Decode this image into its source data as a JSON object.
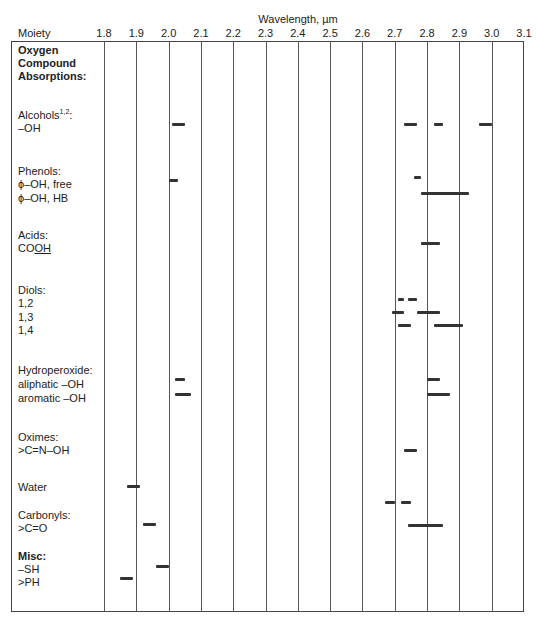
{
  "header": {
    "x_axis_title": "Wavelength, µm",
    "moiety_header": "Moiety"
  },
  "labels": [
    {
      "id": "oxygen-1",
      "text": "Oxygen",
      "y": 44,
      "bold": true
    },
    {
      "id": "oxygen-2",
      "text": "Compound",
      "y": 57,
      "bold": true
    },
    {
      "id": "oxygen-3",
      "text": "Absorptions:",
      "y": 70,
      "bold": true
    },
    {
      "id": "alcohols",
      "text": "Alcohols",
      "sup": "1,2",
      "suffix": ":",
      "y": 109
    },
    {
      "id": "alcohols-oh",
      "text": "–OH",
      "y": 122
    },
    {
      "id": "phenols",
      "text": "Phenols:",
      "y": 165
    },
    {
      "id": "phenol-free",
      "text": "ϕ–OH, free",
      "y": 178
    },
    {
      "id": "phenol-hb",
      "text": "ϕ–OH, HB",
      "y": 192
    },
    {
      "id": "acids",
      "text": "Acids:",
      "y": 229
    },
    {
      "id": "cooh",
      "text": "CO",
      "underline": "OH",
      "y": 242
    },
    {
      "id": "diols",
      "text": "Diols:",
      "y": 284
    },
    {
      "id": "diol-12",
      "text": "1,2",
      "y": 297
    },
    {
      "id": "diol-13",
      "text": "1,3",
      "y": 311
    },
    {
      "id": "diol-14",
      "text": "1,4",
      "y": 324
    },
    {
      "id": "hydroperoxide",
      "text": "Hydroperoxide:",
      "y": 364
    },
    {
      "id": "hp-aliphatic",
      "text": "aliphatic –OH",
      "y": 378
    },
    {
      "id": "hp-aromatic",
      "text": "aromatic –OH",
      "y": 392
    },
    {
      "id": "oximes",
      "text": "Oximes:",
      "y": 431
    },
    {
      "id": "oxime-group",
      "text": ">C=N–OH",
      "y": 444
    },
    {
      "id": "water",
      "text": "Water",
      "y": 481
    },
    {
      "id": "carbonyls",
      "text": "Carbonyls:",
      "y": 509
    },
    {
      "id": "carbonyl-group",
      "text": ">C=O",
      "y": 522
    },
    {
      "id": "misc",
      "text": "Misc:",
      "y": 550,
      "bold": true
    },
    {
      "id": "sh",
      "text": "–SH",
      "y": 563
    },
    {
      "id": "ph",
      "text": ">PH",
      "y": 576
    }
  ],
  "chart_data": {
    "type": "range-bar",
    "xlabel": "Wavelength, µm",
    "ylabel": "Moiety",
    "xlim": [
      1.8,
      3.1
    ],
    "x_ticks": [
      "1.8",
      "1.9",
      "2.0",
      "2.1",
      "2.2",
      "2.3",
      "2.4",
      "2.5",
      "2.6",
      "2.7",
      "2.8",
      "2.9",
      "3.0",
      "3.1"
    ],
    "grid": "vertical",
    "rows": [
      {
        "group": "Alcohols",
        "moiety": "–OH",
        "y": 124,
        "ranges": [
          [
            2.01,
            2.05
          ],
          [
            2.73,
            2.77
          ],
          [
            2.82,
            2.85
          ],
          [
            2.96,
            3.0
          ]
        ]
      },
      {
        "group": "Phenols",
        "moiety": "ϕ–OH, free",
        "y": 180,
        "ranges": [
          [
            2.0,
            2.03
          ]
        ]
      },
      {
        "group": "Phenols",
        "moiety": "ϕ–OH, free",
        "y": 177,
        "ranges": [
          [
            2.76,
            2.78
          ]
        ]
      },
      {
        "group": "Phenols",
        "moiety": "ϕ–OH, HB",
        "y": 193,
        "ranges": [
          [
            2.78,
            2.93
          ]
        ]
      },
      {
        "group": "Acids",
        "moiety": "COOH",
        "y": 243,
        "ranges": [
          [
            2.78,
            2.84
          ]
        ]
      },
      {
        "group": "Diols",
        "moiety": "1,2",
        "y": 299,
        "ranges": [
          [
            2.71,
            2.73
          ],
          [
            2.74,
            2.77
          ]
        ]
      },
      {
        "group": "Diols",
        "moiety": "1,3",
        "y": 312,
        "ranges": [
          [
            2.69,
            2.73
          ],
          [
            2.77,
            2.84
          ]
        ]
      },
      {
        "group": "Diols",
        "moiety": "1,4",
        "y": 325,
        "ranges": [
          [
            2.71,
            2.75
          ],
          [
            2.82,
            2.91
          ]
        ]
      },
      {
        "group": "Hydroperoxide",
        "moiety": "aliphatic –OH",
        "y": 379,
        "ranges": [
          [
            2.02,
            2.05
          ],
          [
            2.8,
            2.84
          ]
        ]
      },
      {
        "group": "Hydroperoxide",
        "moiety": "aromatic –OH",
        "y": 394,
        "ranges": [
          [
            2.02,
            2.07
          ],
          [
            2.8,
            2.87
          ]
        ]
      },
      {
        "group": "Oximes",
        "moiety": ">C=N–OH",
        "y": 450,
        "ranges": [
          [
            2.73,
            2.77
          ]
        ]
      },
      {
        "group": "Water",
        "moiety": "Water",
        "y": 486,
        "ranges": [
          [
            1.87,
            1.91
          ]
        ]
      },
      {
        "group": "Water",
        "moiety": "Water",
        "y": 502,
        "ranges": [
          [
            2.67,
            2.7
          ],
          [
            2.72,
            2.75
          ]
        ]
      },
      {
        "group": "Carbonyls",
        "moiety": ">C=O",
        "y": 524,
        "ranges": [
          [
            1.92,
            1.96
          ]
        ]
      },
      {
        "group": "Carbonyls",
        "moiety": ">C=O",
        "y": 525,
        "ranges": [
          [
            2.74,
            2.85
          ]
        ]
      },
      {
        "group": "Misc",
        "moiety": "–SH",
        "y": 566,
        "ranges": [
          [
            1.96,
            2.0
          ]
        ]
      },
      {
        "group": "Misc",
        "moiety": ">PH",
        "y": 578,
        "ranges": [
          [
            1.85,
            1.89
          ]
        ]
      }
    ]
  },
  "colors": {
    "bar": "#333333",
    "grid": "#555555",
    "text": "#222222"
  }
}
